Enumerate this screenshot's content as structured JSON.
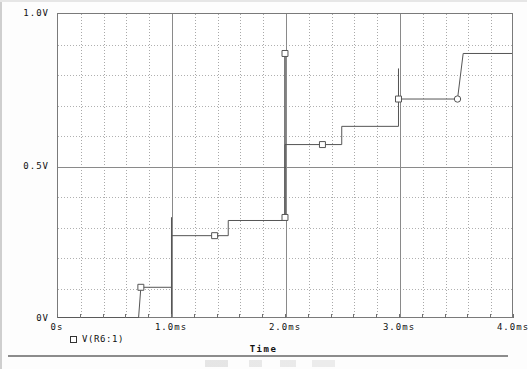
{
  "window": {
    "kind": "spice-probe-plot",
    "caption_partial": ""
  },
  "plot": {
    "x_axis_title": "Time",
    "y_axis_title": "",
    "legend": [
      {
        "marker": "square-marker-icon",
        "label": "V(R6:1)",
        "color": "#555555"
      }
    ],
    "x_ticks": [
      {
        "value": 0.0,
        "label": "0s"
      },
      {
        "value": 1.0,
        "label": "1.0ms"
      },
      {
        "value": 2.0,
        "label": "2.0ms"
      },
      {
        "value": 3.0,
        "label": "3.0ms"
      },
      {
        "value": 4.0,
        "label": "4.0ms"
      }
    ],
    "y_ticks": [
      {
        "value": 0.0,
        "label": "0V"
      },
      {
        "value": 0.5,
        "label": "0.5V"
      },
      {
        "value": 1.0,
        "label": "1.0V"
      }
    ]
  },
  "chart_data": {
    "type": "line",
    "title": "",
    "subtitle": "",
    "xlabel": "Time",
    "ylabel": "",
    "xunit": "ms",
    "yunit": "V",
    "xlim": [
      0.0,
      4.0
    ],
    "ylim": [
      0.0,
      1.0
    ],
    "grid": true,
    "grid_major_x": [
      0.0,
      1.0,
      2.0,
      3.0,
      4.0
    ],
    "grid_minor_x_step": 0.2,
    "grid_major_y": [
      0.0,
      0.5,
      1.0
    ],
    "grid_minor_y_step": 0.1,
    "legend_position": "below-left",
    "series": [
      {
        "name": "V(R6:1)",
        "color": "#555555",
        "style": "staircase",
        "x": [
          0.0,
          0.71,
          0.73,
          1.0,
          1.0,
          1.0,
          1.0,
          1.38,
          1.5,
          1.5,
          2.0,
          2.0,
          2.0,
          2.0,
          2.33,
          2.5,
          2.5,
          3.0,
          3.0,
          3.0,
          3.0,
          3.52,
          3.57,
          4.0
        ],
        "y": [
          0.0,
          0.0,
          0.1,
          0.1,
          0.33,
          0.0,
          0.27,
          0.27,
          0.27,
          0.32,
          0.32,
          0.87,
          0.33,
          0.57,
          0.57,
          0.57,
          0.63,
          0.63,
          0.82,
          0.72,
          0.72,
          0.72,
          0.87,
          0.87
        ],
        "markers": [
          {
            "x": 0.73,
            "y": 0.1,
            "shape": "square"
          },
          {
            "x": 1.38,
            "y": 0.27,
            "shape": "square"
          },
          {
            "x": 2.0,
            "y": 0.87,
            "shape": "square"
          },
          {
            "x": 2.0,
            "y": 0.33,
            "shape": "square"
          },
          {
            "x": 2.33,
            "y": 0.57,
            "shape": "square"
          },
          {
            "x": 3.0,
            "y": 0.72,
            "shape": "square"
          },
          {
            "x": 3.52,
            "y": 0.72,
            "shape": "circle"
          }
        ],
        "description": "Rising staircase / sample-and-hold style waveform with narrow vertical transition spikes at 1.0ms, 2.0ms and 3.0ms."
      }
    ]
  }
}
